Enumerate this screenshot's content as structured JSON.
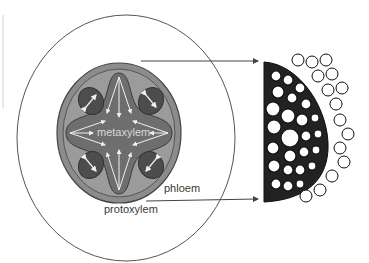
{
  "diagram": {
    "type": "root cross-section (stele) with micrograph",
    "labels": {
      "center": "metaxylem",
      "phloem": "phloem",
      "protoxylem": "protoxylem"
    },
    "colors": {
      "cortex_outline": "#555555",
      "stele_outer": "#8a8a8a",
      "stele_ring": "#9b9b9b",
      "xylem_cross": "#6e6e6e",
      "phloem_bundle": "#4d4d4d",
      "arrows": "#f0f0f0",
      "pointer_lines": "#444444"
    },
    "pointers": [
      {
        "from": "cortex",
        "to": "micrograph-top"
      },
      {
        "from": "protoxylem",
        "to": "micrograph-bottom"
      }
    ]
  }
}
